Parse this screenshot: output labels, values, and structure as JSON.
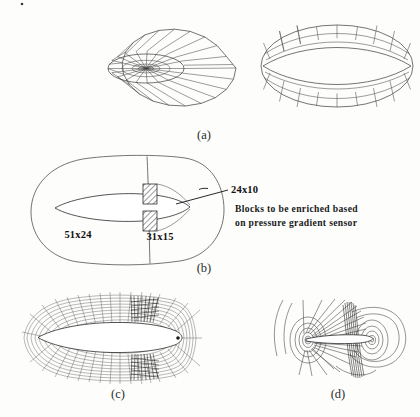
{
  "figure": {
    "background_color": "#fdfdfc",
    "line_color": "#4a4a4a",
    "panels": [
      {
        "id": "a",
        "label": "(a)",
        "caption": "O-grid topology: planar radial view and three-dimensional ring view",
        "views": [
          "planar-radial-o-grid",
          "three-dimensional-o-grid"
        ]
      },
      {
        "id": "b",
        "label": "(b)",
        "caption": "Block decomposition with block dimensions and enrichment regions"
      },
      {
        "id": "c",
        "label": "(c)",
        "caption": "Generated structured mesh with enriched blocks near the trailing edge"
      },
      {
        "id": "d",
        "label": "(d)",
        "caption": "Pressure contours showing the shock captured by the enriched blocks"
      }
    ]
  },
  "panel_b": {
    "block_labels": [
      {
        "name": "upstream-block",
        "text": "51x24",
        "x": 78,
        "y": 238
      },
      {
        "name": "downstream-block",
        "text": "31x15",
        "x": 158,
        "y": 240
      },
      {
        "name": "enriched-block",
        "text": "24x10",
        "x": 232,
        "y": 193
      }
    ],
    "annotation": {
      "line1": "Blocks to be enriched based",
      "line2": "on pressure gradient sensor",
      "x": 232,
      "y": 214
    }
  },
  "colors": {
    "mesh": "#4a4a4a",
    "mesh_dark": "#1e1e1e",
    "text": "#111111",
    "panel_label": "#2b2b2b",
    "body": "#ffffff",
    "background": "#fdfdfc"
  },
  "icons": {
    "leader_line": "leader-line-icon",
    "hatch_block": "hatched-block-icon"
  }
}
